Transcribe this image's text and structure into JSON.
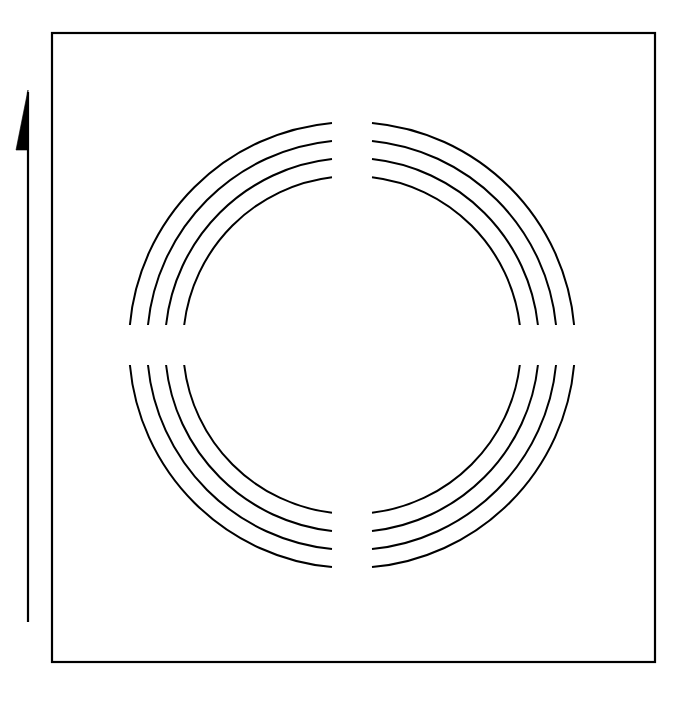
{
  "figure": {
    "background_color": "#ffffff",
    "stroke_color": "#000000",
    "canvas": {
      "width": 691,
      "height": 702
    }
  },
  "frame": {
    "name": "outer-border-rectangle",
    "x": 52,
    "y": 33,
    "width": 603,
    "height": 629,
    "stroke_width": 2.2,
    "fill": "none"
  },
  "arrow": {
    "name": "vertical-direction-arrow",
    "direction": "up",
    "shaft_x": 28,
    "shaft_top_y": 92,
    "shaft_bottom_y": 622,
    "shaft_width": 2.2,
    "head_apex_x": 28,
    "head_apex_y": 90,
    "head_left_x": 16,
    "head_base_y": 150,
    "head_fill": "#000000"
  },
  "rings": {
    "name": "concentric-ring-group",
    "center_x": 352,
    "center_y": 345,
    "count": 4,
    "stroke_width": 2.0,
    "radii": [
      223,
      205,
      187,
      169
    ],
    "gap_half_width": 20,
    "gap_half_height": 20,
    "labels": [
      "ring-outer-1",
      "ring-2",
      "ring-3",
      "ring-inner-4"
    ],
    "segments_per_ring": 4,
    "segment_names": [
      "arc-top-left",
      "arc-top-right",
      "arc-bottom-right",
      "arc-bottom-left"
    ]
  }
}
